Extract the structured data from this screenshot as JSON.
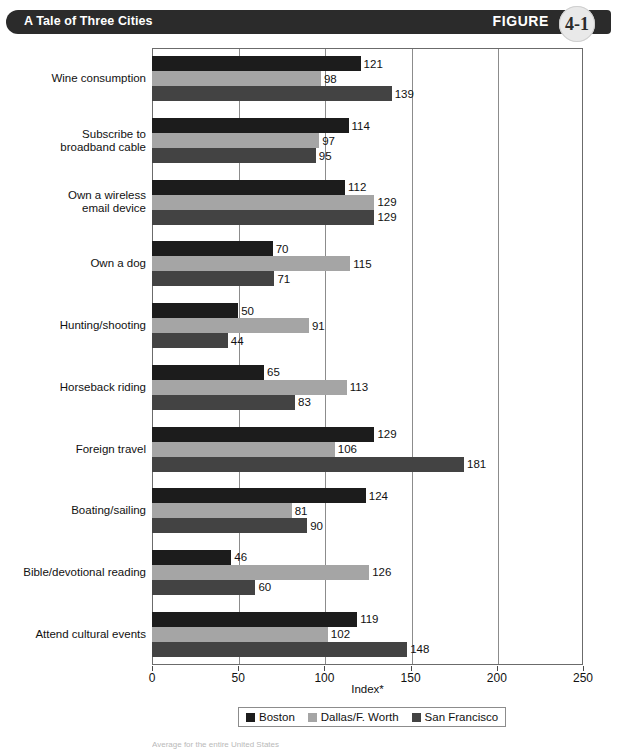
{
  "header": {
    "title": "A Tale of Three Cities",
    "figure_word": "FIGURE",
    "figure_number": "4-1"
  },
  "footnote": {
    "text": "Average for the entire United States"
  },
  "chart_data": {
    "type": "bar",
    "orientation": "horizontal",
    "title": "A Tale of Three Cities",
    "xlabel": "Index*",
    "ylabel": "",
    "xlim": [
      0,
      250
    ],
    "xticks": [
      0,
      50,
      100,
      150,
      200,
      250
    ],
    "grid": true,
    "legend_position": "bottom",
    "categories": [
      "Wine consumption",
      "Subscribe to broadband cable",
      "Own a wireless email device",
      "Own a dog",
      "Hunting/shooting",
      "Horseback riding",
      "Foreign travel",
      "Boating/sailing",
      "Bible/devotional reading",
      "Attend cultural events"
    ],
    "category_lines": [
      [
        "Wine consumption"
      ],
      [
        "Subscribe to",
        "broadband cable"
      ],
      [
        "Own a wireless",
        "email device"
      ],
      [
        "Own a dog"
      ],
      [
        "Hunting/shooting"
      ],
      [
        "Horseback riding"
      ],
      [
        "Foreign travel"
      ],
      [
        "Boating/sailing"
      ],
      [
        "Bible/devotional reading"
      ],
      [
        "Attend cultural events"
      ]
    ],
    "series": [
      {
        "name": "Boston",
        "color": "#1c1c1c",
        "values": [
          121,
          114,
          112,
          70,
          50,
          65,
          129,
          124,
          46,
          119
        ]
      },
      {
        "name": "Dallas/F. Worth",
        "color": "#a5a5a5",
        "values": [
          98,
          97,
          129,
          115,
          91,
          113,
          106,
          81,
          126,
          102
        ]
      },
      {
        "name": "San Francisco",
        "color": "#434343",
        "values": [
          139,
          95,
          129,
          71,
          44,
          83,
          181,
          90,
          60,
          148
        ]
      }
    ]
  },
  "legend": [
    {
      "label": "Boston",
      "color": "#1c1c1c"
    },
    {
      "label": "Dallas/F. Worth",
      "color": "#a5a5a5"
    },
    {
      "label": "San Francisco",
      "color": "#434343"
    }
  ]
}
